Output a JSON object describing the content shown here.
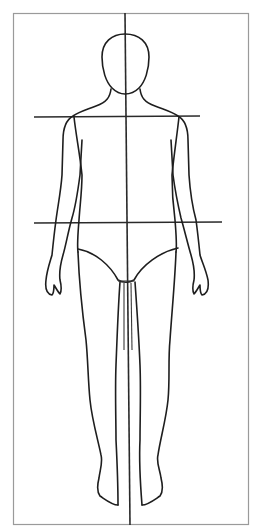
{
  "figure": {
    "type": "front-view body croquis template",
    "frame": {
      "x": 13,
      "y": 13,
      "width": 235,
      "height": 512
    },
    "center_line_x": 126,
    "guides": {
      "shoulder_line": {
        "x1": 34,
        "x2": 200,
        "y": 117
      },
      "hip_line": {
        "x1": 34,
        "x2": 222,
        "y": 223
      }
    },
    "colors": {
      "outline": "#1e1e1e",
      "frame": "#9a9a9a",
      "background": "#ffffff"
    }
  }
}
